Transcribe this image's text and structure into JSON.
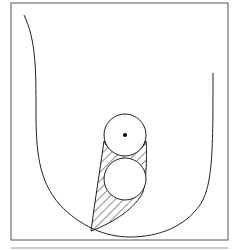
{
  "diagram": {
    "type": "schematic",
    "labels": [],
    "colors": {
      "stroke": "#222222",
      "frame": "#555555",
      "background": "#ffffff",
      "bottom_rule": "#bbbbbb"
    },
    "elements": {
      "frame": {
        "x": 11,
        "y": 3,
        "width": 217,
        "height": 237
      },
      "outer_vessel": "U-shaped curve",
      "upper_circle": {
        "cx": 125,
        "cy": 135,
        "r": 21,
        "has_center_dot": true
      },
      "lower_circle": {
        "cx": 125,
        "cy": 179,
        "r": 21
      },
      "hatched_region": "diagonal hatch surrounding the circles, tapering to the bottom-left"
    }
  }
}
